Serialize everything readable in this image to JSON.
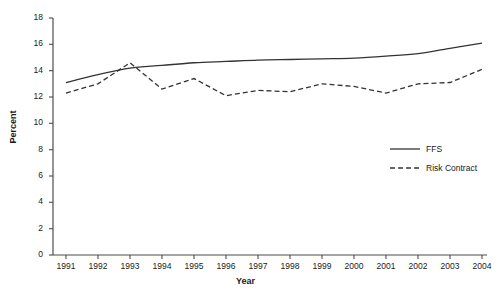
{
  "chart_data": {
    "type": "line",
    "title": "",
    "xlabel": "Year",
    "ylabel": "Percent",
    "x": [
      1991,
      1992,
      1993,
      1994,
      1995,
      1996,
      1997,
      1998,
      1999,
      2000,
      2001,
      2002,
      2003,
      2004
    ],
    "categories": [
      "1991",
      "1992",
      "1993",
      "1994",
      "1995",
      "1996",
      "1997",
      "1998",
      "1999",
      "2000",
      "2001",
      "2002",
      "2003",
      "2004"
    ],
    "xlim": [
      1991,
      2004
    ],
    "ylim": [
      0,
      18
    ],
    "yticks": [
      0,
      2,
      4,
      6,
      8,
      10,
      12,
      14,
      16,
      18
    ],
    "ytick_labels": [
      "0",
      "2",
      "4",
      "6",
      "8",
      "10",
      "12",
      "14",
      "16",
      "18"
    ],
    "grid": false,
    "legend_position": "center-right",
    "series": [
      {
        "name": "FFS",
        "style": "solid",
        "color": "#333333",
        "values": [
          13.1,
          13.7,
          14.2,
          14.4,
          14.6,
          14.7,
          14.8,
          14.85,
          14.9,
          14.95,
          15.1,
          15.3,
          15.7,
          16.1
        ]
      },
      {
        "name": "Risk Contract",
        "style": "dashed",
        "color": "#333333",
        "values": [
          12.3,
          13.0,
          14.6,
          12.6,
          13.4,
          12.1,
          12.5,
          12.4,
          13.0,
          12.8,
          12.3,
          13.0,
          13.1,
          14.1
        ]
      }
    ]
  },
  "axes": {
    "y_title": "Percent",
    "x_title": "Year"
  },
  "legend": {
    "items": [
      {
        "label": "FFS",
        "style": "solid"
      },
      {
        "label": "Risk Contract",
        "style": "dashed"
      }
    ]
  }
}
